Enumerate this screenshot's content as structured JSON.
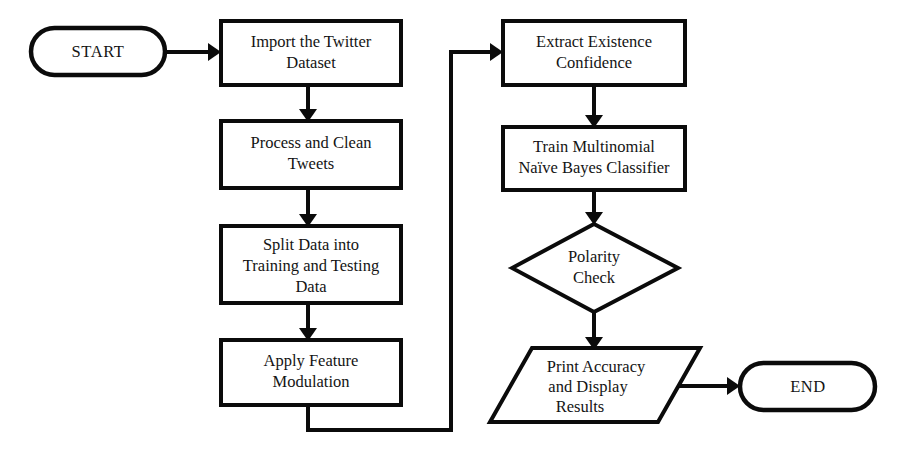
{
  "diagram": {
    "type": "flowchart",
    "background_color": "#ffffff",
    "line_color": "#0b0b0b",
    "text_color": "#141414",
    "nodes": [
      {
        "id": "start",
        "shape": "terminator",
        "label": "START",
        "lines": [
          "START"
        ]
      },
      {
        "id": "import_dataset",
        "shape": "process",
        "label": "Import the Twitter Dataset",
        "lines": [
          "Import the Twitter",
          "Dataset"
        ]
      },
      {
        "id": "process_clean",
        "shape": "process",
        "label": "Process and Clean Tweets",
        "lines": [
          "Process and Clean",
          "Tweets"
        ]
      },
      {
        "id": "split_data",
        "shape": "process",
        "label": "Split Data into Training and Testing Data",
        "lines": [
          "Split Data into",
          "Training and Testing",
          "Data"
        ]
      },
      {
        "id": "apply_feature",
        "shape": "process",
        "label": "Apply Feature Modulation",
        "lines": [
          "Apply Feature",
          "Modulation"
        ]
      },
      {
        "id": "extract_existence",
        "shape": "process",
        "label": "Extract Existence Confidence",
        "lines": [
          "Extract Existence",
          "Confidence"
        ]
      },
      {
        "id": "train_classifier",
        "shape": "process",
        "label": "Train Multinomial Naïve Bayes Classifier",
        "lines": [
          "Train Multinomial",
          "Naïve Bayes Classifier"
        ]
      },
      {
        "id": "polarity_check",
        "shape": "decision",
        "label": "Polarity Check",
        "lines": [
          "Polarity",
          "Check"
        ]
      },
      {
        "id": "print_results",
        "shape": "input-output",
        "label": "Print Accuracy and Display Results",
        "lines": [
          "Print Accuracy",
          "and Display",
          "Results"
        ]
      },
      {
        "id": "end",
        "shape": "terminator",
        "label": "END",
        "lines": [
          "END"
        ]
      }
    ],
    "edges": [
      {
        "id": "e1",
        "from": "start",
        "to": "import_dataset",
        "label": ""
      },
      {
        "id": "e2",
        "from": "import_dataset",
        "to": "process_clean",
        "label": ""
      },
      {
        "id": "e3",
        "from": "process_clean",
        "to": "split_data",
        "label": ""
      },
      {
        "id": "e4",
        "from": "split_data",
        "to": "apply_feature",
        "label": ""
      },
      {
        "id": "e5",
        "from": "apply_feature",
        "to": "extract_existence",
        "label": ""
      },
      {
        "id": "e6",
        "from": "extract_existence",
        "to": "train_classifier",
        "label": ""
      },
      {
        "id": "e7",
        "from": "train_classifier",
        "to": "polarity_check",
        "label": ""
      },
      {
        "id": "e8",
        "from": "polarity_check",
        "to": "print_results",
        "label": ""
      },
      {
        "id": "e9",
        "from": "print_results",
        "to": "end",
        "label": ""
      }
    ]
  }
}
